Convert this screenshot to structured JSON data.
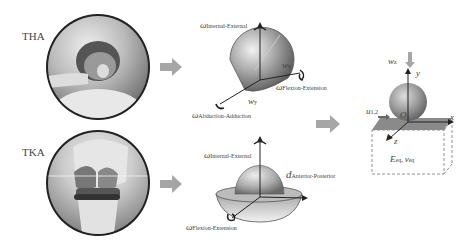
{
  "rows": [
    {
      "label": "THA",
      "image": "hip-implant-icon",
      "model": {
        "labels": {
          "top": {
            "symbol": "ω",
            "sub": "Internal-External"
          },
          "right": {
            "symbol": "ω",
            "sub": "Flexion-Extension"
          },
          "bottom": {
            "symbol": "ω",
            "sub": "Abduction-Adduction"
          },
          "wx": {
            "symbol": "w",
            "sub": "x"
          },
          "wy": {
            "symbol": "w",
            "sub": "y"
          }
        }
      }
    },
    {
      "label": "TKA",
      "image": "knee-implant-icon",
      "model": {
        "labels": {
          "top": {
            "symbol": "ω",
            "sub": "Internal-External"
          },
          "right": {
            "symbol": "d",
            "sub": "Anterior-Posterior"
          },
          "bottom": {
            "symbol": "ω",
            "sub": "Flexion-Extension"
          }
        }
      }
    }
  ],
  "contact_model": {
    "load": {
      "symbol": "w",
      "sub": "z"
    },
    "displacement": {
      "symbol": "u",
      "sub": "1,2"
    },
    "axes": {
      "x": "x",
      "y": "y",
      "z": "z",
      "origin": "O"
    },
    "material": {
      "E": "E",
      "E_sub": "eq",
      "sep": ", ",
      "nu": "ν",
      "nu_sub": "eq"
    }
  },
  "colors": {
    "arrow": "#a6a6a6",
    "outline": "#222222",
    "sphere": "#9a9a9a",
    "plane": "#8a8a8a"
  }
}
